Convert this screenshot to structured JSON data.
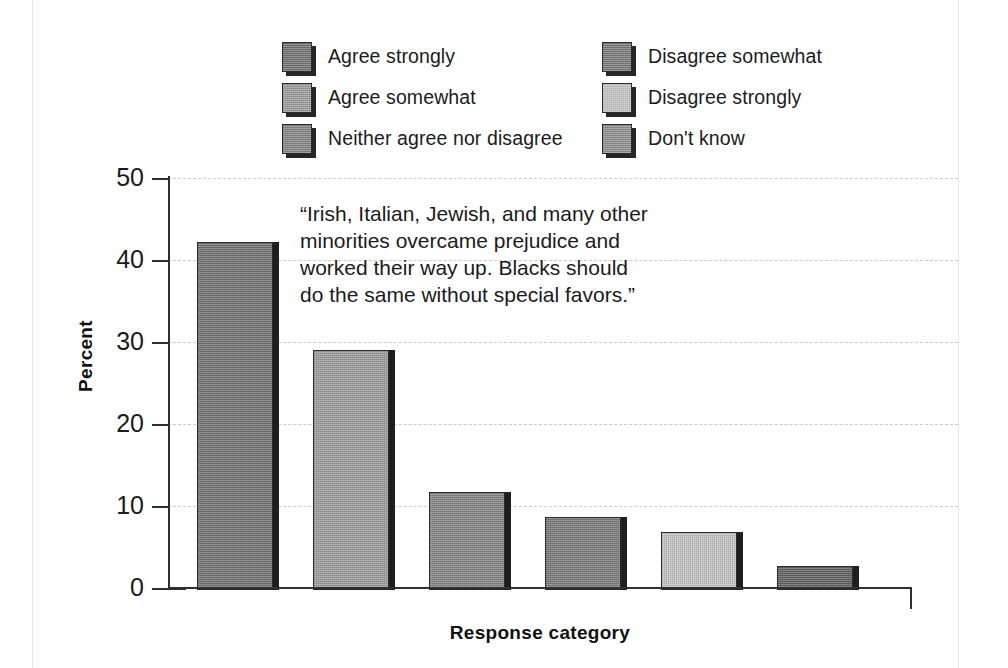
{
  "chart_data": {
    "type": "bar",
    "title": "",
    "subtitle": "",
    "xlabel": "Response category",
    "ylabel": "Percent",
    "ylim": [
      0,
      50
    ],
    "yticks": [
      0,
      10,
      20,
      30,
      40,
      50
    ],
    "grid": "horizontal-dashed",
    "legend_position": "top",
    "annotation": "“Irish, Italian, Jewish, and many other\nminorities overcame prejudice and\nworked their way up. Blacks should\ndo the same without special favors.”",
    "categories": [
      "Agree strongly",
      "Agree somewhat",
      "Neither agree nor disagree",
      "Disagree somewhat",
      "Disagree strongly",
      "Don't know"
    ],
    "values": [
      42.2,
      29.0,
      11.7,
      8.7,
      6.8,
      2.7
    ],
    "bar_colors": [
      "#6f6f6f",
      "#9a9a9a",
      "#828282",
      "#777777",
      "#c3c3c3",
      "#5e5e5e"
    ]
  },
  "legend": {
    "items": [
      {
        "label": "Agree strongly",
        "color": "#6f6f6f"
      },
      {
        "label": "Disagree somewhat",
        "color": "#777777"
      },
      {
        "label": "Agree somewhat",
        "color": "#9a9a9a"
      },
      {
        "label": "Disagree strongly",
        "color": "#c3c3c3"
      },
      {
        "label": "Neither agree nor disagree",
        "color": "#828282"
      },
      {
        "label": "Don't know",
        "color": "#8d8d8d"
      }
    ]
  },
  "axes": {
    "ytick_labels": [
      "50",
      "40",
      "30",
      "20",
      "10",
      "0"
    ],
    "ylabel": "Percent",
    "xlabel": "Response category"
  },
  "quote": {
    "text": "“Irish, Italian, Jewish, and many other\nminorities overcame prejudice and\nworked their way up. Blacks should\ndo the same without special favors.”"
  }
}
